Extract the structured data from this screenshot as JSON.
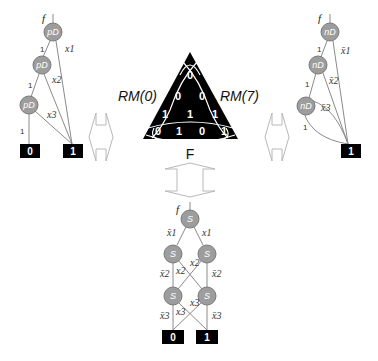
{
  "triangle": {
    "left_label": "RM(0)",
    "right_label": "RM(7)",
    "bottom_label": "F",
    "cells": [
      "0",
      "0",
      "0",
      "1",
      "1",
      "1",
      "0",
      "1",
      "0",
      "1"
    ]
  },
  "left_diagram": {
    "function_label": "f",
    "nodes": [
      "pD",
      "pD",
      "pD"
    ],
    "edge_labels": {
      "e1": "1",
      "e2": "1",
      "e3": "1",
      "x1": "x1",
      "x2": "x2",
      "x3": "x3"
    },
    "terminals": [
      "0",
      "1"
    ]
  },
  "right_diagram": {
    "function_label": "f",
    "nodes": [
      "nD",
      "nD",
      "nD"
    ],
    "edge_labels": {
      "e1": "1",
      "e2": "1",
      "e3": "1",
      "x1": "x̄1",
      "x2": "x̄2",
      "x3": "x̄3"
    },
    "terminals": [
      "1"
    ]
  },
  "bottom_diagram": {
    "function_label": "f",
    "nodes": [
      "S",
      "S",
      "S",
      "S",
      "S"
    ],
    "edge_labels": {
      "top_left": "x̄1",
      "top_right": "x1",
      "mid_left": "x̄2",
      "mid_cross_a": "x2",
      "mid_cross_b": "x2",
      "mid_right": "x̄2",
      "bot_left": "x̄3",
      "bot_cross_a": "x3",
      "bot_cross_b": "x3",
      "bot_right": "x̄3"
    },
    "terminals": [
      "0",
      "1"
    ]
  },
  "colors": {
    "node_fill": "#9d9d9d",
    "terminal_fill": "#000000",
    "triangle_fill": "#000000",
    "arrow_stroke": "#b8b8b8"
  }
}
